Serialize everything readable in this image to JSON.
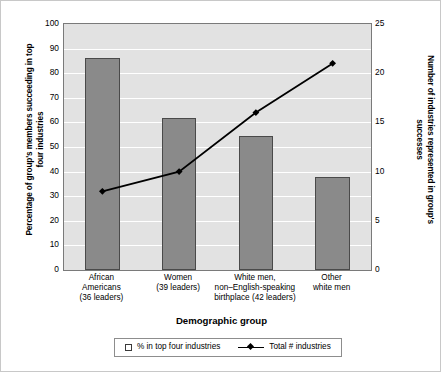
{
  "chart_data": {
    "type": "bar",
    "title": "",
    "categories": [
      "African\nAmericans\n(36 leaders)",
      "Women\n(39 leaders)",
      "White men,\nnon–English-speaking\nbirthplace (42 leaders)",
      "Other\nwhite men"
    ],
    "xlabel": "Demographic group",
    "ylabel": "Percentage of group's members succeeding in top four industries",
    "ylabel_right": "Number of industries represented in group's successes",
    "ylim": [
      0,
      100
    ],
    "ylim_right": [
      0,
      25
    ],
    "yticks": [
      0,
      10,
      20,
      30,
      40,
      50,
      60,
      70,
      80,
      90,
      100
    ],
    "yticks_right": [
      0,
      5,
      10,
      15,
      20,
      25
    ],
    "grid": true,
    "legend_position": "bottom",
    "series": [
      {
        "name": "% in top four industries",
        "type": "bar",
        "axis": "left",
        "values": [
          86,
          62,
          54.5,
          38
        ],
        "color": "#8a8a8a"
      },
      {
        "name": "Total # industries",
        "type": "line",
        "axis": "right",
        "values": [
          8,
          10,
          16,
          21
        ],
        "color": "#000000"
      }
    ]
  },
  "legend": {
    "entries": [
      {
        "label": "% in top four industries",
        "marker": "square-outline-icon"
      },
      {
        "label": "Total # industries",
        "marker": "line-diamond-icon"
      }
    ]
  }
}
